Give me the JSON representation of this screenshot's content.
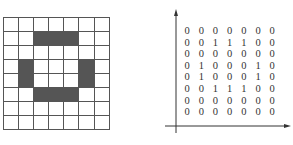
{
  "left_figure": {
    "type": "pixel-grid",
    "rows": 8,
    "cols": 7,
    "fill_color": "#555555",
    "cells": [
      [
        0,
        0,
        0,
        0,
        0,
        0,
        0
      ],
      [
        0,
        0,
        1,
        1,
        1,
        0,
        0
      ],
      [
        0,
        0,
        0,
        0,
        0,
        0,
        0
      ],
      [
        0,
        1,
        0,
        0,
        0,
        1,
        0
      ],
      [
        0,
        1,
        0,
        0,
        0,
        1,
        0
      ],
      [
        0,
        0,
        1,
        1,
        1,
        0,
        0
      ],
      [
        0,
        0,
        0,
        0,
        0,
        0,
        0
      ],
      [
        0,
        0,
        0,
        0,
        0,
        0,
        0
      ]
    ]
  },
  "right_figure": {
    "type": "binary-matrix-with-axes",
    "matrix": [
      [
        "0",
        "0",
        "0",
        "0",
        "0",
        "0",
        "0"
      ],
      [
        "0",
        "0",
        "1",
        "1",
        "1",
        "0",
        "0"
      ],
      [
        "0",
        "0",
        "0",
        "0",
        "0",
        "0",
        "0"
      ],
      [
        "0",
        "1",
        "0",
        "0",
        "0",
        "1",
        "0"
      ],
      [
        "0",
        "1",
        "0",
        "0",
        "0",
        "1",
        "0"
      ],
      [
        "0",
        "0",
        "1",
        "1",
        "1",
        "0",
        "0"
      ],
      [
        "0",
        "0",
        "0",
        "0",
        "0",
        "0",
        "0"
      ],
      [
        "0",
        "0",
        "0",
        "0",
        "0",
        "0",
        "0"
      ]
    ]
  }
}
